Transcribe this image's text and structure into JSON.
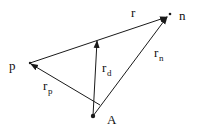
{
  "diagram": {
    "type": "vector-triangle",
    "colors": {
      "stroke": "#1a1a1a",
      "background": "#ffffff"
    },
    "points": {
      "A": {
        "label": "A",
        "x": 93,
        "y": 116
      },
      "p": {
        "label": "p",
        "x": 30,
        "y": 63
      },
      "n": {
        "label": "n",
        "x": 168,
        "y": 16
      },
      "d": {
        "x": 97,
        "y": 40
      }
    },
    "vectors": [
      {
        "name": "r",
        "from": "p",
        "to": "n",
        "label": "r",
        "sub": ""
      },
      {
        "name": "r_p",
        "from": "A",
        "to": "p",
        "label": "r",
        "sub": "p"
      },
      {
        "name": "r_n",
        "from": "A",
        "to": "n",
        "label": "r",
        "sub": "n"
      },
      {
        "name": "r_d",
        "from": "A",
        "to": "d",
        "label": "r",
        "sub": "d"
      }
    ],
    "labels": {
      "r": "r",
      "rp_main": "r",
      "rp_sub": "p",
      "rn_main": "r",
      "rn_sub": "n",
      "rd_main": "r",
      "rd_sub": "d",
      "point_p": "p",
      "point_n": "n",
      "point_A": "A"
    }
  }
}
